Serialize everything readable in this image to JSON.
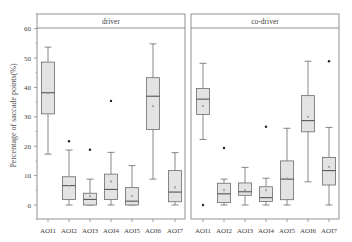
{
  "chart_data": {
    "type": "box",
    "title": "",
    "ylabel": "Percentage of saccade points(%)",
    "xlabel": "",
    "ylim": [
      -5,
      65
    ],
    "yticks": [
      0,
      10,
      20,
      30,
      40,
      50,
      60
    ],
    "grid": false,
    "categories": [
      "AOI1",
      "AOI2",
      "AOI3",
      "AOI4",
      "AOI5",
      "AOI6",
      "AOI7"
    ],
    "panels": [
      {
        "name": "driver",
        "series": [
          {
            "category": "AOI1",
            "min": 17.3,
            "q1": 31.0,
            "median": 38.2,
            "q3": 48.6,
            "max": 53.7,
            "mean": 38.0,
            "outliers": []
          },
          {
            "category": "AOI2",
            "min": 0.0,
            "q1": 1.9,
            "median": 6.6,
            "q3": 9.6,
            "max": 18.7,
            "mean": 6.5,
            "outliers": [
              21.7
            ]
          },
          {
            "category": "AOI3",
            "min": 0.0,
            "q1": 0.0,
            "median": 1.9,
            "q3": 4.0,
            "max": 8.8,
            "mean": 3.0,
            "outliers": [
              18.8
            ]
          },
          {
            "category": "AOI4",
            "min": 0.0,
            "q1": 1.9,
            "median": 5.3,
            "q3": 10.5,
            "max": 17.9,
            "mean": 8.0,
            "outliers": [
              35.4
            ]
          },
          {
            "category": "AOI5",
            "min": 0.0,
            "q1": 0.0,
            "median": 1.3,
            "q3": 5.9,
            "max": 13.4,
            "mean": 3.0,
            "outliers": []
          },
          {
            "category": "AOI6",
            "min": 8.8,
            "q1": 25.7,
            "median": 37.0,
            "q3": 43.3,
            "max": 54.8,
            "mean": 33.6,
            "outliers": []
          },
          {
            "category": "AOI7",
            "min": 0.0,
            "q1": 1.1,
            "median": 4.4,
            "q3": 11.7,
            "max": 17.8,
            "mean": 6.0,
            "outliers": []
          }
        ]
      },
      {
        "name": "co-driver",
        "series": [
          {
            "category": "AOI1",
            "min": 22.3,
            "q1": 30.8,
            "median": 36.0,
            "q3": 39.6,
            "max": 48.2,
            "mean": 33.7,
            "outliers": [
              0.0
            ]
          },
          {
            "category": "AOI2",
            "min": 0.0,
            "q1": 0.8,
            "median": 3.8,
            "q3": 7.4,
            "max": 8.8,
            "mean": 5.0,
            "outliers": [
              19.4
            ]
          },
          {
            "category": "AOI3",
            "min": 0.0,
            "q1": 3.3,
            "median": 4.5,
            "q3": 7.5,
            "max": 12.8,
            "mean": 5.0,
            "outliers": []
          },
          {
            "category": "AOI4",
            "min": 0.0,
            "q1": 1.2,
            "median": 2.5,
            "q3": 6.2,
            "max": 9.1,
            "mean": 5.0,
            "outliers": [
              26.6
            ]
          },
          {
            "category": "AOI5",
            "min": 0.0,
            "q1": 1.8,
            "median": 8.8,
            "q3": 15.0,
            "max": 26.1,
            "mean": 9.0,
            "outliers": []
          },
          {
            "category": "AOI6",
            "min": 7.9,
            "q1": 24.9,
            "median": 28.7,
            "q3": 37.2,
            "max": 48.9,
            "mean": 30.0,
            "outliers": []
          },
          {
            "category": "AOI7",
            "min": 0.0,
            "q1": 6.8,
            "median": 11.7,
            "q3": 16.2,
            "max": 26.4,
            "mean": 13.0,
            "outliers": [
              48.9
            ]
          }
        ]
      }
    ]
  },
  "colors": {
    "box_fill": "#e3e3e3",
    "box_stroke": "#6a6a6a",
    "axis": "#777777",
    "text": "#444444",
    "outlier": "#222222"
  }
}
